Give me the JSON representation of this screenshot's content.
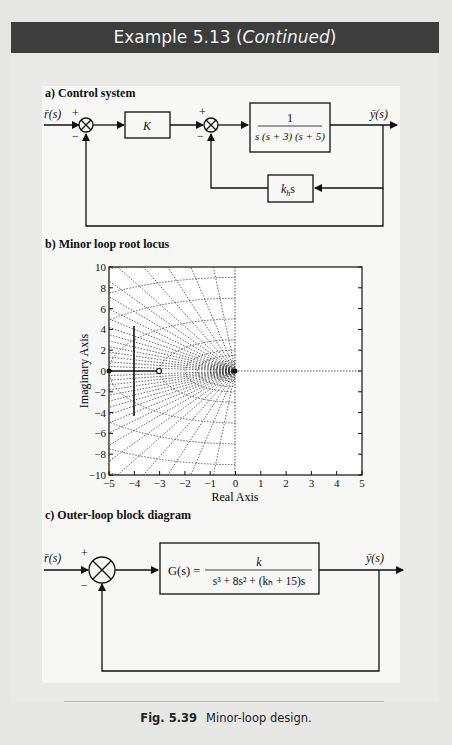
{
  "header": {
    "title_prefix": "Example 5.13 (",
    "title_italic": "Continued",
    "title_suffix": ")"
  },
  "panels": {
    "a": {
      "label": "a) Control system",
      "input": "r̄(s)",
      "output": "ȳ(s)",
      "sum1_signs": {
        "top": "+",
        "bottom": "−"
      },
      "sum2_signs": {
        "top": "+",
        "bottom": "−"
      },
      "gain_block": "K",
      "plant_block": {
        "numerator": "1",
        "denominator": "s (s + 3) (s + 5)"
      },
      "feedback_block": {
        "main": "k",
        "sub": "h",
        "suffix": "s"
      }
    },
    "b": {
      "label": "b) Minor loop root locus",
      "xlabel": "Real Axis",
      "ylabel": "Imaginary Axis"
    },
    "c": {
      "label": "c) Outer-loop block diagram",
      "input": "r̄(s)",
      "output": "ȳ(s)",
      "sum_signs": {
        "top": "+",
        "bottom": "−"
      },
      "block": {
        "lhs": "G(s) =",
        "numerator": "k",
        "denominator": "s³ + 8s² + (kₕ + 15)s"
      }
    }
  },
  "chart_data": {
    "type": "line",
    "title": "b) Minor loop root locus",
    "xlabel": "Real Axis",
    "ylabel": "Imaginary Axis",
    "xlim": [
      -5,
      5
    ],
    "ylim": [
      -10,
      10
    ],
    "xticks": [
      -5,
      -4,
      -3,
      -2,
      -1,
      0,
      1,
      2,
      3,
      4,
      5
    ],
    "yticks": [
      10,
      8,
      6,
      4,
      2,
      0,
      -2,
      -4,
      -6,
      -8,
      -10
    ],
    "grid": "s-plane damping/natural-frequency grid (left half plane, dotted)",
    "poles": [
      [
        -5,
        0
      ],
      [
        0,
        0
      ]
    ],
    "zeros": [
      [
        -3,
        0
      ]
    ],
    "series": [
      {
        "name": "real-axis locus",
        "x": [
          -5,
          -3
        ],
        "y": [
          0,
          0
        ]
      },
      {
        "name": "upper branch",
        "x": [
          -4,
          -4
        ],
        "y": [
          0,
          4.3
        ]
      },
      {
        "name": "lower branch",
        "x": [
          -4,
          -4
        ],
        "y": [
          0,
          -4.3
        ]
      }
    ]
  },
  "caption": {
    "fig": "Fig. 5.39",
    "text": "Minor-loop design."
  }
}
